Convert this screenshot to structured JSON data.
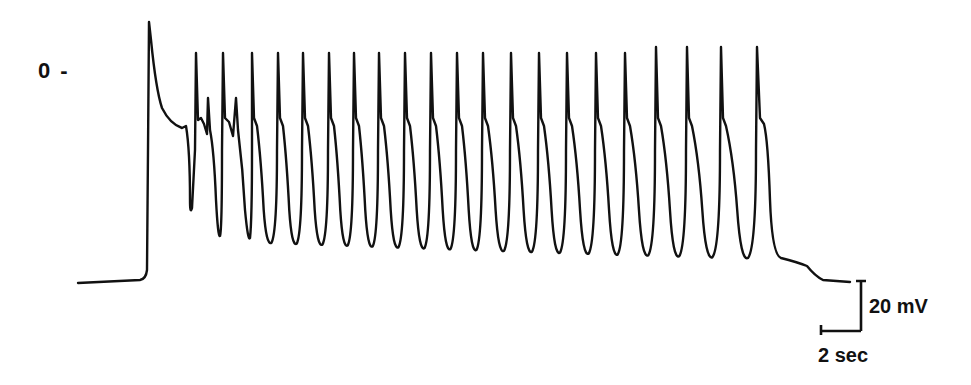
{
  "chart_data": {
    "type": "line",
    "title": "",
    "xlabel": "",
    "ylabel": "",
    "y_reference": {
      "label": "0 -",
      "value_mV": 0
    },
    "scale_bars": {
      "voltage": {
        "label": "20 mV",
        "value": 20,
        "unit": "mV"
      },
      "time": {
        "label": "2 sec",
        "value": 2,
        "unit": "sec"
      }
    },
    "trace": {
      "resting_level_start_px_y": 283,
      "resting_level_end_px_y": 282,
      "onset_px_x": 148,
      "initial_peak_px_y": 22,
      "spike_peak_px_y": 53,
      "spike_trough_px_y": 240,
      "offset_px_x": 770,
      "spike_x_px": [
        196,
        223,
        252,
        278,
        303,
        329,
        354,
        379,
        405,
        431,
        457,
        483,
        511,
        539,
        567,
        596,
        625,
        656,
        687,
        721,
        757
      ],
      "secondary_spike_x_px": [
        208,
        236
      ]
    },
    "series": [
      {
        "name": "membrane potential",
        "color": "#111111"
      }
    ]
  },
  "labels": {
    "zero": "0 -",
    "mv": "20 mV",
    "sec": "2 sec"
  },
  "colors": {
    "trace": "#111111",
    "background": "#ffffff"
  }
}
